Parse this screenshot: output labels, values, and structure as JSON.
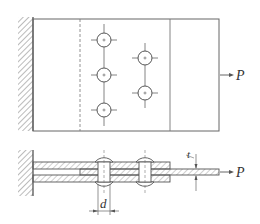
{
  "figure": {
    "plan_view": {
      "load_label": "P",
      "rivet_rows": [
        {
          "x": 104,
          "ys": [
            40,
            75,
            110
          ]
        },
        {
          "x": 145,
          "ys": [
            58,
            93
          ]
        }
      ]
    },
    "section_view": {
      "load_label": "P",
      "diameter_label": "d",
      "thickness_label": "t"
    },
    "colors": {
      "line": "#555555",
      "hatch": "#777777",
      "background": "#ffffff"
    }
  }
}
